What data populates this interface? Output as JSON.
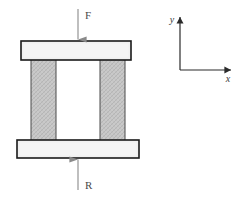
{
  "figure": {
    "background_color": "#ffffff"
  },
  "colors": {
    "plate_fill": "#f0f0f0",
    "plate_stroke": "#1a1a1a",
    "column_fill": "#c8c8c8",
    "column_stroke": "#3a3a3a",
    "hatch_stroke": "#b0b0b0",
    "arrow_color": "#808080",
    "axis_color": "#2a2a2a",
    "label_color": "#4a4a4a"
  },
  "structure": {
    "top_plate": {
      "name": "top-plate",
      "x": 21,
      "y": 41,
      "width": 110,
      "height": 19
    },
    "bottom_plate": {
      "name": "bottom-plate",
      "x": 17,
      "y": 140,
      "width": 122,
      "height": 18
    },
    "columns": [
      {
        "name": "left-column",
        "x": 31,
        "y": 60,
        "width": 25,
        "height": 80
      },
      {
        "name": "right-column",
        "x": 100,
        "y": 60,
        "width": 25,
        "height": 80
      }
    ]
  },
  "forces": {
    "applied": {
      "label": "F",
      "label_x": 85,
      "label_y": 19,
      "line_x": 78,
      "line_y_start": 9,
      "line_y_end": 40,
      "direction": "down"
    },
    "reaction": {
      "label": "R",
      "label_x": 85,
      "label_y": 189,
      "line_x": 78,
      "line_y_start": 190,
      "line_y_end": 159,
      "direction": "up"
    }
  },
  "axes": {
    "origin_x": 180,
    "origin_y": 70,
    "y_axis": {
      "label": "y",
      "tip_y": 16,
      "label_x": 172,
      "label_y": 23
    },
    "x_axis": {
      "label": "x",
      "tip_x": 232,
      "label_x": 228,
      "label_y": 82
    }
  }
}
